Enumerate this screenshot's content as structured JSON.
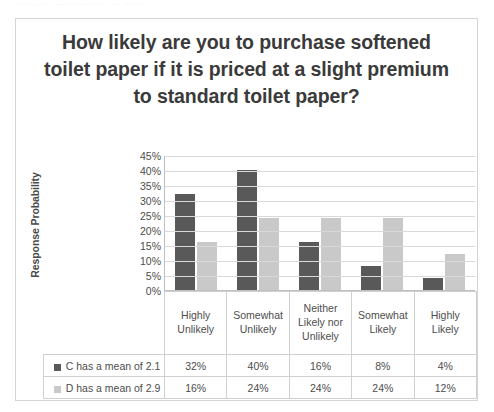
{
  "scan_sliver_text": "·· ·  ···· ·· ·   ··· ·· ····  ··  ·· ·    ··· ···  ·· ·",
  "chart": {
    "title": "How likely are you to purchase softened toilet paper if it is priced at a slight premium to standard toilet paper?",
    "y_axis_title": "Response Probability"
  },
  "chart_data": {
    "type": "bar",
    "title": "How likely are you to purchase softened toilet paper if it is priced at a slight premium to standard toilet paper?",
    "xlabel": "",
    "ylabel": "Response Probability",
    "ylim": [
      0,
      45
    ],
    "grid": true,
    "legend_position": "bottom-table",
    "categories": [
      "Highly Unlikely",
      "Somewhat Unlikely",
      "Neither Likely nor Unlikely",
      "Somewhat Likely",
      "Highly Likely"
    ],
    "ytick_labels": [
      "45%",
      "40%",
      "35%",
      "30%",
      "25%",
      "20%",
      "15%",
      "10%",
      "5%",
      "0%"
    ],
    "ytick_values": [
      45,
      40,
      35,
      30,
      25,
      20,
      15,
      10,
      5,
      0
    ],
    "series": [
      {
        "name": "C has a mean of 2.1",
        "color": "#595959",
        "values": [
          32,
          40,
          16,
          8,
          4
        ],
        "labels": [
          "32%",
          "40%",
          "16%",
          "8%",
          "4%"
        ]
      },
      {
        "name": "D has a mean of 2.9",
        "color": "#c9c9c9",
        "values": [
          16,
          24,
          24,
          24,
          12
        ],
        "labels": [
          "16%",
          "24%",
          "24%",
          "24%",
          "12%"
        ]
      }
    ]
  }
}
